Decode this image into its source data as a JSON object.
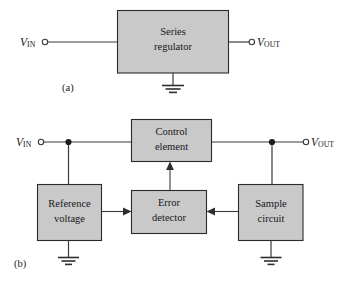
{
  "figure": {
    "colors": {
      "block_fill": "#c9c9c9",
      "block_stroke": "#2b2b2b",
      "wire": "#3a3a3a",
      "text": "#17171b",
      "background": "#ffffff"
    }
  },
  "part_a": {
    "label": "(a)",
    "input_terminal": {
      "v": "V",
      "sub": "IN"
    },
    "output_terminal": {
      "v": "V",
      "sub": "OUT"
    },
    "block": {
      "line1": "Series",
      "line2": "regulator"
    },
    "ground": "ground-symbol"
  },
  "part_b": {
    "label": "(b)",
    "input_terminal": {
      "v": "V",
      "sub": "IN"
    },
    "output_terminal": {
      "v": "V",
      "sub": "OUT"
    },
    "blocks": [
      {
        "id": "control-element",
        "line1": "Control",
        "line2": "element"
      },
      {
        "id": "reference-voltage",
        "line1": "Reference",
        "line2": "voltage"
      },
      {
        "id": "error-detector",
        "line1": "Error",
        "line2": "detector"
      },
      {
        "id": "sample-circuit",
        "line1": "Sample",
        "line2": "circuit"
      }
    ],
    "grounds": [
      "reference-voltage-ground",
      "sample-circuit-ground"
    ],
    "junctions": [
      "input-node",
      "output-node"
    ],
    "arrows": [
      {
        "from": "reference-voltage",
        "to": "error-detector",
        "direction": "right"
      },
      {
        "from": "sample-circuit",
        "to": "error-detector",
        "direction": "left"
      },
      {
        "from": "error-detector",
        "to": "control-element",
        "direction": "up"
      }
    ]
  }
}
